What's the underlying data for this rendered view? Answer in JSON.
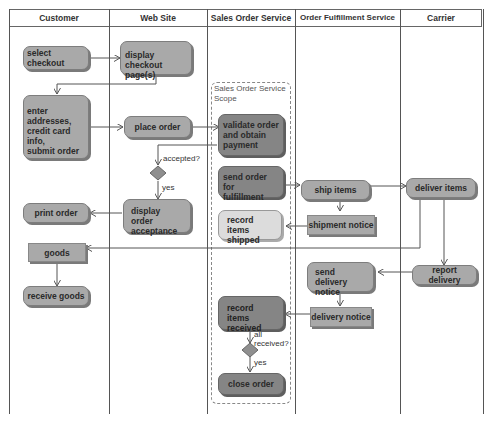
{
  "lanes": [
    {
      "title": "Customer"
    },
    {
      "title": "Web Site"
    },
    {
      "title": "Sales Order Service"
    },
    {
      "title": "Order Fulfillment Service"
    },
    {
      "title": "Carrier"
    }
  ],
  "scope": {
    "label_line1": "Sales Order Service",
    "label_line2": "Scope"
  },
  "nodes": {
    "select_checkout": "select checkout",
    "display_checkout": {
      "l1": "display checkout",
      "l2": "page(s)"
    },
    "enter_addresses": {
      "l1": "enter",
      "l2": "addresses,",
      "l3": "credit card info,",
      "l4": "submit order"
    },
    "place_order": "place order",
    "validate_order": {
      "l1": "validate order",
      "l2": "and obtain",
      "l3": "payment"
    },
    "send_order": {
      "l1": "send order for",
      "l2": "fulfillment"
    },
    "ship_items": "ship items",
    "deliver_items": "deliver items",
    "shipment_notice": "shipment notice",
    "record_shipped": {
      "l1": "record items",
      "l2": "shipped"
    },
    "display_acceptance": {
      "l1": "display order",
      "l2": "acceptance"
    },
    "print_order": "print order",
    "goods": "goods",
    "receive_goods": "receive goods",
    "send_delivery_notice": {
      "l1": "send delivery",
      "l2": "notice"
    },
    "report_delivery": "report delivery",
    "delivery_notice": "delivery notice",
    "record_received": {
      "l1": "record items",
      "l2": "received"
    },
    "close_order": "close order"
  },
  "guards": {
    "accepted": "accepted?",
    "yes1": "yes",
    "all_received_1": "all",
    "all_received_2": "received?",
    "yes2": "yes"
  },
  "colors": {
    "node": "#a9a9a9",
    "node_dark": "#858585",
    "node_light": "#dcdcdc",
    "line": "#555555"
  }
}
